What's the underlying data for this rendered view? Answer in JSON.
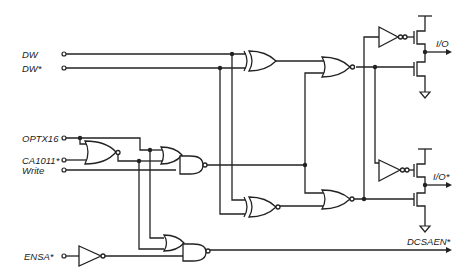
{
  "diagram": {
    "type": "logic-circuit-schematic",
    "inputs": [
      {
        "id": "dw",
        "label": "DW"
      },
      {
        "id": "dw_n",
        "label": "DW*"
      },
      {
        "id": "optx16",
        "label": "OPTX16"
      },
      {
        "id": "ca1011_n",
        "label": "CA1011*"
      },
      {
        "id": "write",
        "label": "Write"
      },
      {
        "id": "ensa_n",
        "label": "ENSA*"
      }
    ],
    "outputs": [
      {
        "id": "io",
        "label": "I/O"
      },
      {
        "id": "io_n",
        "label": "I/O*"
      },
      {
        "id": "dcsaen_n",
        "label": "DCSAEN*"
      }
    ],
    "components": [
      {
        "id": "nor_opt",
        "type": "NOR",
        "inputs": [
          "OPTX16",
          "CA1011*"
        ]
      },
      {
        "id": "or_and_1",
        "type": "OR-NAND",
        "inputs": [
          "OPTX16",
          "NOR_OPT",
          "Write"
        ]
      },
      {
        "id": "xor_top",
        "type": "XOR",
        "inputs": [
          "DW",
          "DW*"
        ]
      },
      {
        "id": "nor_top",
        "type": "NOR"
      },
      {
        "id": "xnor_bot",
        "type": "XNOR",
        "inputs": [
          "DW",
          "DW*"
        ]
      },
      {
        "id": "nor_bot",
        "type": "NOR"
      },
      {
        "id": "inv_top",
        "type": "INVERTER"
      },
      {
        "id": "inv_bot",
        "type": "INVERTER"
      },
      {
        "id": "inv_ensa",
        "type": "INVERTER",
        "inputs": [
          "ENSA*"
        ]
      },
      {
        "id": "or_and_2",
        "type": "OR-NAND",
        "output": "DCSAEN*"
      },
      {
        "id": "driver_top",
        "type": "CMOS push-pull driver",
        "output": "I/O"
      },
      {
        "id": "driver_bot",
        "type": "CMOS push-pull driver",
        "output": "I/O*"
      }
    ]
  }
}
